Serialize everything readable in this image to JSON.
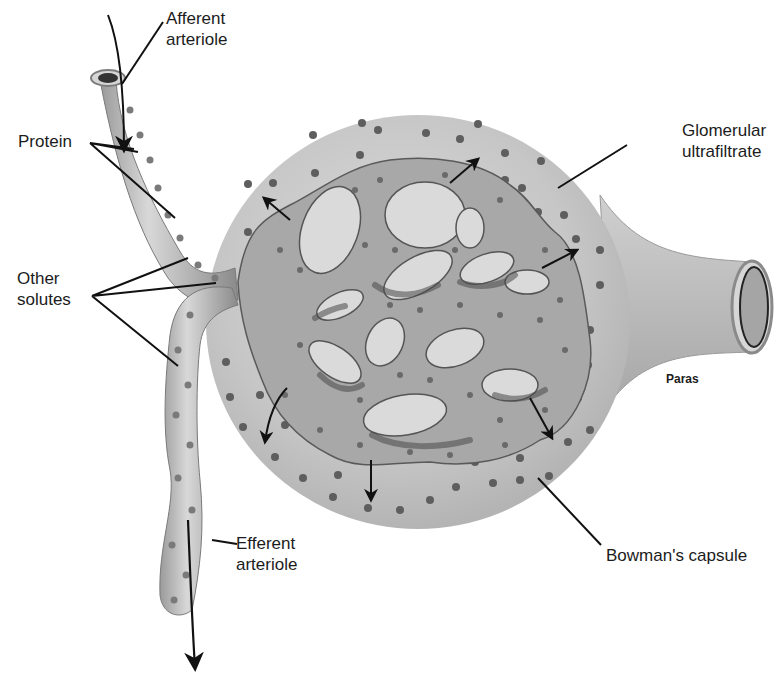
{
  "diagram": {
    "colors": {
      "background": "#ffffff",
      "capsule_fill": "#c9c9c9",
      "capillary_fill": "#a9a9a9",
      "capillary_dark": "#6e6e6e",
      "dot": "#5c5c5c",
      "line": "#111111"
    },
    "labels": {
      "afferent_line1": "Afferent",
      "afferent_line2": "arteriole",
      "protein": "Protein",
      "other_solutes_line1": "Other",
      "other_solutes_line2": "solutes",
      "glomerular_line1": "Glomerular",
      "glomerular_line2": "ultrafiltrate",
      "paras": "Paras",
      "bowmans_capsule": "Bowman's capsule",
      "efferent_line1": "Efferent",
      "efferent_line2": "arteriole"
    },
    "arrows": [
      {
        "name": "inflow-arrow",
        "direction": "down",
        "location": "afferent arteriole"
      },
      {
        "name": "outflow-arrow",
        "direction": "down",
        "location": "efferent arteriole"
      },
      {
        "name": "filtration-arrow",
        "direction": "up-left"
      },
      {
        "name": "filtration-arrow",
        "direction": "up-right"
      },
      {
        "name": "filtration-arrow",
        "direction": "right"
      },
      {
        "name": "filtration-arrow",
        "direction": "down-left"
      },
      {
        "name": "filtration-arrow",
        "direction": "down"
      },
      {
        "name": "filtration-arrow",
        "direction": "down-right"
      }
    ]
  }
}
